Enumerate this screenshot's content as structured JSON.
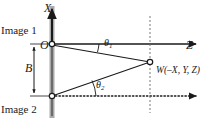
{
  "figure": {
    "background_color": "#ffffff",
    "ink_color": "#1a1a1a",
    "bar_color": "#9a9a9a"
  },
  "labels": {
    "image1": "Image 1",
    "image2": "Image 2",
    "axis_x": "X",
    "axis_z": "Z",
    "origin": "O",
    "baseline": "B",
    "theta1_base": "θ",
    "theta1_sub": "1",
    "theta2_base": "θ",
    "theta2_sub": "2",
    "point_w": "W(–X, Y, Z)"
  },
  "geometry": {
    "image_plane_bar": {
      "x": 50,
      "y_top": 6,
      "y_bottom": 118,
      "width": 5
    },
    "camera1_origin": {
      "x": 52,
      "y": 44
    },
    "camera2_origin": {
      "x": 52,
      "y": 96
    },
    "world_point_w": {
      "x": 150,
      "y": 62
    },
    "x_axis": {
      "from_y": 44,
      "to_y": 8,
      "x": 52
    },
    "z_axis_top": {
      "y": 44,
      "from_x": 52,
      "to_x": 198
    },
    "z_axis_bottom": {
      "y": 96,
      "from_x": 52,
      "to_x": 198,
      "style": "dotted"
    },
    "vertical_dashed_at_w": {
      "x": 150,
      "from_y": 16,
      "to_y": 112
    },
    "baseline_dimension": {
      "x": 34,
      "from_y": 44,
      "to_y": 96
    },
    "theta1_arc_radius": 46,
    "theta2_arc_radius": 44
  }
}
